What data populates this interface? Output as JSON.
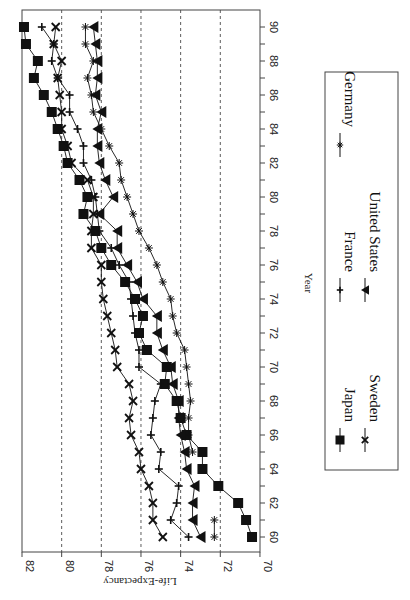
{
  "chart_data": {
    "type": "line",
    "orientation": "rotated 90° clockwise (x-axis Year on right edge, y-axis Life-Expectancy on bottom edge, reversed)",
    "title": "",
    "xlabel": "Year",
    "ylabel": "Life-Expectancy",
    "xlim": [
      60,
      90
    ],
    "ylim": [
      70,
      82
    ],
    "x_ticks": [
      60,
      62,
      64,
      66,
      68,
      70,
      72,
      74,
      76,
      78,
      80,
      82,
      84,
      86,
      88,
      90
    ],
    "y_ticks": [
      70,
      72,
      74,
      76,
      78,
      80,
      82
    ],
    "grid": "dashed horizontal lines at 72, 74, 76, 78, 80",
    "legend_position": "right (boxed, two rows)",
    "x": [
      60,
      61,
      62,
      63,
      64,
      65,
      66,
      67,
      68,
      69,
      70,
      71,
      72,
      73,
      74,
      75,
      76,
      77,
      78,
      79,
      80,
      81,
      82,
      83,
      84,
      85,
      86,
      87,
      88,
      89,
      90
    ],
    "series": [
      {
        "name": "Japan",
        "marker": "square",
        "values": [
          70.4,
          70.7,
          71.1,
          72.1,
          72.9,
          72.9,
          73.7,
          74.0,
          74.2,
          74.8,
          74.7,
          75.7,
          76.1,
          75.9,
          76.3,
          76.8,
          77.5,
          78.0,
          78.3,
          78.9,
          78.7,
          79.1,
          79.7,
          79.9,
          80.2,
          80.5,
          80.9,
          81.4,
          81.2,
          81.8,
          81.9
        ]
      },
      {
        "name": "France",
        "marker": "plus",
        "values": [
          73.6,
          74.5,
          74.2,
          74.1,
          75.1,
          75.0,
          75.5,
          75.4,
          75.3,
          75.0,
          76.1,
          76.1,
          76.3,
          76.4,
          76.5,
          76.6,
          77.1,
          77.5,
          78.1,
          78.2,
          78.3,
          78.5,
          78.9,
          78.9,
          79.2,
          79.6,
          79.6,
          80.2,
          80.5,
          80.4,
          81.0
        ]
      },
      {
        "name": "Germany",
        "marker": "asterisk",
        "values": [
          72.3,
          72.3,
          null,
          null,
          null,
          73.4,
          73.6,
          73.6,
          73.5,
          73.6,
          73.7,
          73.8,
          74.2,
          74.4,
          74.5,
          74.9,
          75.2,
          75.6,
          76.1,
          76.4,
          76.7,
          77.0,
          77.1,
          77.6,
          78.0,
          78.4,
          78.5,
          78.7,
          78.4,
          78.8,
          78.8
        ]
      },
      {
        "name": "Sweden",
        "marker": "x",
        "values": [
          74.9,
          75.4,
          75.4,
          75.6,
          76.0,
          76.1,
          76.5,
          76.6,
          76.4,
          76.6,
          77.2,
          77.3,
          77.5,
          77.7,
          77.9,
          78.0,
          78.0,
          78.5,
          78.5,
          78.4,
          78.4,
          78.7,
          79.5,
          79.7,
          80.0,
          80.0,
          80.1,
          80.2,
          80.0,
          80.4,
          80.3
        ]
      },
      {
        "name": "United States",
        "marker": "triangle",
        "values": [
          73.0,
          73.4,
          73.4,
          73.3,
          73.7,
          73.8,
          74.0,
          74.1,
          74.1,
          74.4,
          74.5,
          74.9,
          75.2,
          75.2,
          75.9,
          76.2,
          76.7,
          77.2,
          77.2,
          78.1,
          77.4,
          77.8,
          78.1,
          78.2,
          78.2,
          78.0,
          78.3,
          78.2,
          78.2,
          78.3,
          78.4
        ]
      }
    ]
  },
  "legend": {
    "items": [
      {
        "label": "Japan",
        "marker": "square"
      },
      {
        "label": "France",
        "marker": "plus"
      },
      {
        "label": "Germany",
        "marker": "asterisk"
      },
      {
        "label": "Sweden",
        "marker": "x"
      },
      {
        "label": "United States",
        "marker": "triangle"
      }
    ]
  },
  "colors": {
    "ink": "#111111",
    "grid": "#333333",
    "background": "#ffffff"
  }
}
